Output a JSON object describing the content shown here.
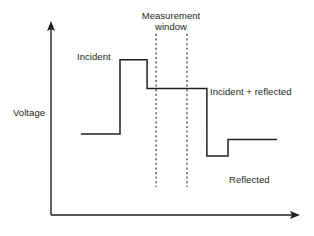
{
  "figure": {
    "background_color": "#ffffff",
    "line_color": "#231f20",
    "text_color": "#231f20"
  },
  "axes": {
    "y_axis_label": "Voltage",
    "x_axis_label": "",
    "y_axis_tick_labels": [],
    "x_axis_tick_labels": [],
    "arrowheads": [
      "y-axis-up",
      "x-axis-right"
    ]
  },
  "annotations": {
    "incident": "Incident",
    "measurement_window_line1": "Measurement",
    "measurement_window_line2": "window",
    "measurement_window": "Measurement window",
    "incident_plus_reflected": "Incident + reflected",
    "reflected": "Reflected"
  },
  "chart_data": {
    "type": "line",
    "title": "",
    "xlabel": "",
    "ylabel": "Voltage",
    "grid": false,
    "legend": null,
    "axis_style": "arrowed, unlabeled ticks",
    "xlim": [
      0,
      100
    ],
    "ylim": [
      0,
      100
    ],
    "series": [
      {
        "name": "voltage-waveform",
        "style": "step",
        "color": "#231f20",
        "points": [
          {
            "x": 12.0,
            "y": 42.0,
            "label": "baseline"
          },
          {
            "x": 27.7,
            "y": 42.0,
            "label": "baseline end"
          },
          {
            "x": 27.7,
            "y": 80.4,
            "label": "incident rise"
          },
          {
            "x": 38.6,
            "y": 80.4,
            "label": "incident plateau"
          },
          {
            "x": 38.6,
            "y": 65.5,
            "label": "step down to incident + reflected"
          },
          {
            "x": 62.6,
            "y": 65.5,
            "label": "incident + reflected plateau"
          },
          {
            "x": 62.6,
            "y": 30.6,
            "label": "fall to reflected trough"
          },
          {
            "x": 71.1,
            "y": 30.6,
            "label": "reflected trough"
          },
          {
            "x": 71.1,
            "y": 39.1,
            "label": "rise to reflected level"
          },
          {
            "x": 90.8,
            "y": 39.1,
            "label": "reflected plateau"
          }
        ]
      }
    ],
    "levels": [
      {
        "name": "baseline",
        "y": 42.0
      },
      {
        "name": "incident",
        "y": 80.4
      },
      {
        "name": "incident + reflected",
        "y": 65.5
      },
      {
        "name": "reflected trough",
        "y": 30.6
      },
      {
        "name": "reflected",
        "y": 39.1
      }
    ],
    "annotations": [
      {
        "text": "Incident",
        "x": 23.0,
        "y": 86.0
      },
      {
        "text": "Measurement window",
        "x": 48.0,
        "y": 98.0
      },
      {
        "text": "Incident + reflected",
        "x": 70.0,
        "y": 69.0
      },
      {
        "text": "Reflected",
        "x": 75.0,
        "y": 25.0
      }
    ],
    "vertical_markers": [
      {
        "name": "measurement-window-start",
        "x": 42.2,
        "style": "dotted"
      },
      {
        "name": "measurement-window-end",
        "x": 54.6,
        "style": "dotted"
      }
    ]
  }
}
